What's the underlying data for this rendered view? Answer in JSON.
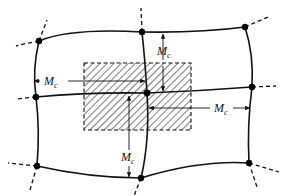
{
  "diagram": {
    "nodes": [
      {
        "id": "n-top-left",
        "x": 39,
        "y": 41
      },
      {
        "id": "n-top-mid",
        "x": 142,
        "y": 32
      },
      {
        "id": "n-top-right",
        "x": 245,
        "y": 27
      },
      {
        "id": "n-mid-left",
        "x": 36,
        "y": 97
      },
      {
        "id": "n-center",
        "x": 147,
        "y": 93
      },
      {
        "id": "n-mid-right",
        "x": 252,
        "y": 87
      },
      {
        "id": "n-bot-left",
        "x": 37,
        "y": 166
      },
      {
        "id": "n-bot-mid",
        "x": 141,
        "y": 178
      },
      {
        "id": "n-bot-right",
        "x": 249,
        "y": 163
      }
    ],
    "hatched_region": {
      "x": 84,
      "y": 63,
      "width": 107,
      "height": 67
    },
    "labels": [
      {
        "id": "mc-left",
        "main": "M",
        "sub": "c",
        "x": 42,
        "y": 88
      },
      {
        "id": "mc-top",
        "main": "M",
        "sub": "c",
        "x": 157,
        "y": 55
      },
      {
        "id": "mc-right",
        "main": "M",
        "sub": "c",
        "x": 216,
        "y": 112
      },
      {
        "id": "mc-bottom",
        "main": "M",
        "sub": "c",
        "x": 117,
        "y": 163
      }
    ]
  }
}
